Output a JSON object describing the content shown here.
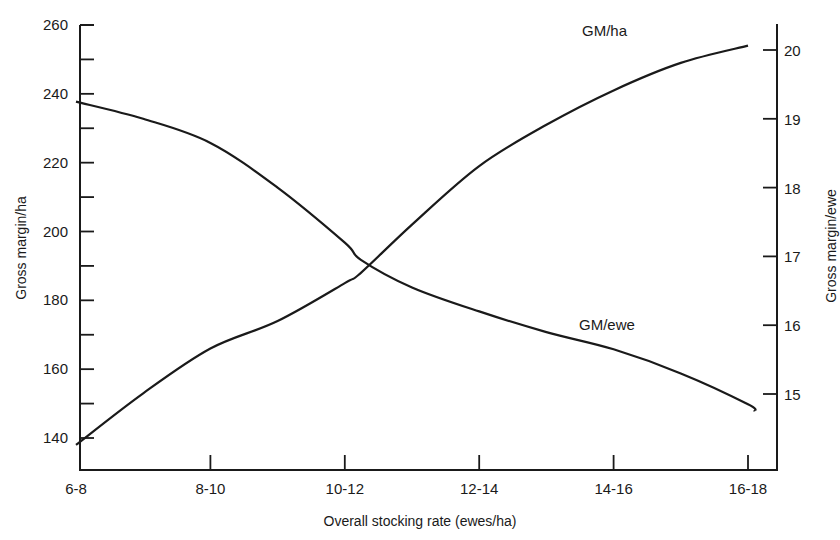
{
  "chart_data": {
    "type": "line",
    "title": "",
    "xlabel": "Overall stocking rate (ewes/ha)",
    "ylabel": "Gross margin/ha",
    "y2label": "Gross margin/ewe",
    "categories": [
      "6-8",
      "8-10",
      "10-12",
      "12-14",
      "14-16",
      "16-18"
    ],
    "ylim": [
      130,
      260
    ],
    "y2lim": [
      14,
      20.4
    ],
    "yticks": [
      140,
      160,
      180,
      200,
      220,
      240,
      260
    ],
    "yminor_step": 10,
    "y2ticks": [
      15,
      16,
      17,
      18,
      19,
      20
    ],
    "grid": false,
    "legend": "inline-labels",
    "series": [
      {
        "name": "GM/ha",
        "axis": "left",
        "label": "GM/ha",
        "x": [
          0,
          0.5,
          1,
          1.5,
          2,
          2.12,
          2.5,
          3,
          3.5,
          4,
          4.5,
          5
        ],
        "values": [
          138,
          153,
          166,
          174,
          185,
          188,
          202,
          219,
          231,
          241,
          249,
          254
        ]
      },
      {
        "name": "GM/ewe",
        "axis": "right",
        "label": "GM/ewe",
        "x": [
          0,
          0.5,
          1,
          1.5,
          2,
          2.12,
          2.5,
          3,
          3.5,
          4,
          4.5,
          5,
          5.05
        ],
        "values": [
          19.25,
          19.0,
          18.65,
          18.0,
          17.2,
          16.95,
          16.55,
          16.2,
          15.9,
          15.65,
          15.3,
          14.85,
          14.75
        ]
      }
    ]
  }
}
